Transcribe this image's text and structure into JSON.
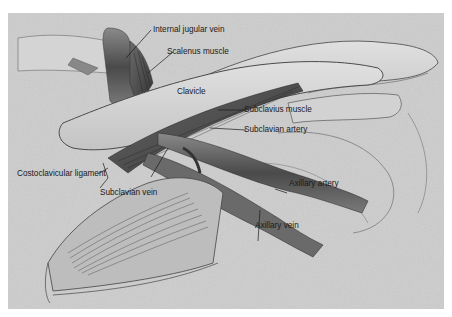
{
  "figure": {
    "style": "grayscale anatomical illustration",
    "colors": {
      "background": "#cfcfcf",
      "border": "#ffffff",
      "bone": "#d8d8d8",
      "vessel_dark": "#5a5a5a",
      "label_text": "#1a1a1a"
    },
    "labels": {
      "internal_jugular_vein": "Internal jugular vein",
      "scalenus_muscle": "Scalenus muscle",
      "clavicle": "Clavicle",
      "subclavius_muscle": "Subclavius muscle",
      "subclavian_artery": "Subclavian artery",
      "costoclavicular_ligament": "Costoclavicular ligament",
      "subclavian_vein": "Subclavian vein",
      "axillary_artery": "Axillary artery",
      "axillary_vein": "Axillary vein"
    }
  }
}
